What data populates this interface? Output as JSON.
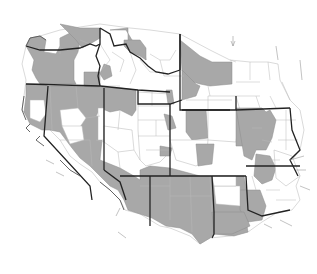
{
  "map": {
    "title": "",
    "region": "Western United States counties",
    "style": "grayscale choropleth",
    "colors": {
      "shaded": "#a8a8a8",
      "unshaded": "#ffffff",
      "state_boundary": "#222222",
      "county_boundary": "#b8b8b8"
    },
    "legend": [
      {
        "label": "",
        "color": "#a8a8a8"
      },
      {
        "label": "",
        "color": "#ffffff"
      }
    ],
    "north_arrow": "A"
  }
}
